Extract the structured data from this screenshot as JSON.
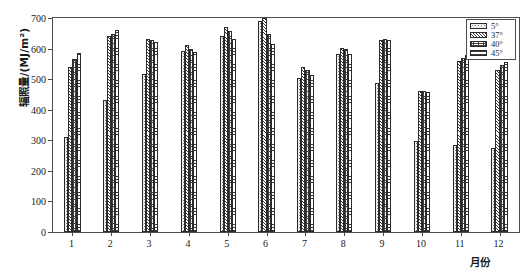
{
  "chart_data": {
    "type": "bar",
    "title": "",
    "xlabel": "月份",
    "ylabel": "辐照量/(MJ/m²)",
    "categories": [
      "1",
      "2",
      "3",
      "4",
      "5",
      "6",
      "7",
      "8",
      "9",
      "10",
      "11",
      "12"
    ],
    "ylim": [
      0,
      700
    ],
    "y_ticks": [
      0,
      100,
      200,
      300,
      400,
      500,
      600,
      700
    ],
    "y_tick_labels": [
      "0",
      "100",
      "200",
      "300",
      "400",
      "500",
      "600",
      "700"
    ],
    "grid": false,
    "legend_position": "top-right",
    "series": [
      {
        "name": "5°",
        "pattern": "sparse-dots",
        "values": [
          310,
          432,
          517,
          593,
          640,
          690,
          505,
          583,
          487,
          298,
          285,
          275
        ]
      },
      {
        "name": "37°",
        "pattern": "diagonal-hatch",
        "values": [
          540,
          641,
          632,
          613,
          672,
          700,
          540,
          602,
          628,
          460,
          560,
          530
        ]
      },
      {
        "name": "40°",
        "pattern": "cross-hatch",
        "values": [
          566,
          648,
          628,
          600,
          657,
          648,
          530,
          600,
          632,
          462,
          568,
          545
        ]
      },
      {
        "name": "45°",
        "pattern": "horizontal-lines",
        "values": [
          586,
          660,
          620,
          590,
          630,
          616,
          512,
          583,
          628,
          458,
          578,
          556
        ]
      }
    ]
  },
  "legend": {
    "items": [
      {
        "label": "5°"
      },
      {
        "label": "37°"
      },
      {
        "label": "40°"
      },
      {
        "label": "45°"
      }
    ]
  },
  "axes": {
    "y_title": "辐照量/(MJ/m²)",
    "x_title": "月份"
  },
  "colors": {
    "axis": "#4d4d4d",
    "bar_outline": "#2b2b2b",
    "background": "#ffffff",
    "text": "#1a1a1a"
  }
}
